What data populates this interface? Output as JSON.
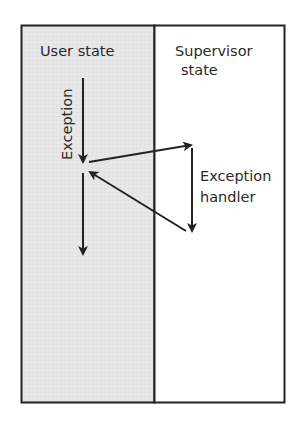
{
  "diagram": {
    "colors": {
      "user_state_fill": "#e4e4e4",
      "supervisor_state_fill": "#ffffff",
      "stroke": "#222222"
    },
    "regions": [
      {
        "id": "user-state",
        "label": "User state"
      },
      {
        "id": "supervisor-state",
        "label_line1": "Supervisor",
        "label_line2": "state"
      }
    ],
    "labels": {
      "exception_vertical": "Exception",
      "handler_line1": "Exception",
      "handler_line2": "handler"
    },
    "arrows": [
      {
        "name": "user-execution-before",
        "from": "user-state",
        "to": "user-state",
        "direction": "down"
      },
      {
        "name": "exception-to-handler",
        "from": "user-state",
        "to": "supervisor-state"
      },
      {
        "name": "handler-execution",
        "from": "supervisor-state",
        "to": "supervisor-state",
        "direction": "down"
      },
      {
        "name": "return-from-handler",
        "from": "supervisor-state",
        "to": "user-state"
      },
      {
        "name": "user-execution-after",
        "from": "user-state",
        "to": "user-state",
        "direction": "down"
      }
    ]
  }
}
